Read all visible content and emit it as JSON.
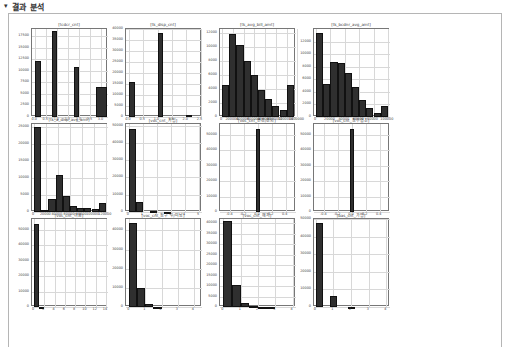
{
  "header": {
    "arrow": "▾",
    "title": "결과 분석"
  },
  "chart_data": [
    {
      "type": "bar",
      "title": "[tcdcr_cnt]",
      "categories": [
        "0.0",
        "0.5",
        "1.0",
        "1.5",
        "2.0",
        "2.5",
        "3.0"
      ],
      "bins": [
        {
          "x0": 0.0,
          "x1": 0.25,
          "value": 12000
        },
        {
          "x0": 0.75,
          "x1": 1.0,
          "value": 18500
        },
        {
          "x0": 1.75,
          "x1": 2.0,
          "value": 10800
        },
        {
          "x0": 2.75,
          "x1": 3.25,
          "value": 6500
        }
      ],
      "xlim": [
        -0.15,
        3.3
      ],
      "ylim": [
        0,
        19000
      ],
      "yticks": [
        0,
        2500,
        5000,
        7500,
        10000,
        12500,
        15000,
        17500
      ],
      "xticks": [
        0.0,
        0.5,
        1.0,
        1.5,
        2.0,
        2.5,
        3.0
      ],
      "xtick_labels": [
        "0.0",
        "0.5",
        "1.0",
        "1.5",
        "2.0",
        "2.5",
        "3.0"
      ]
    },
    {
      "type": "bar",
      "title": "[tk_disp_cnt]",
      "bins": [
        {
          "x0": 0.0,
          "x1": 0.2,
          "value": 16000
        },
        {
          "x0": 1.0,
          "x1": 1.2,
          "value": 38000
        },
        {
          "x0": 2.0,
          "x1": 2.2,
          "value": 800
        }
      ],
      "xlim": [
        -0.1,
        2.55
      ],
      "ylim": [
        0,
        40000
      ],
      "yticks": [
        0,
        5000,
        10000,
        15000,
        20000,
        25000,
        30000,
        35000,
        40000
      ],
      "xticks": [
        0.0,
        0.5,
        1.0,
        1.5,
        2.0,
        2.5
      ],
      "xtick_labels": [
        "0.0",
        "0.5",
        "1.0",
        "1.5",
        "2.0",
        "2.5"
      ]
    },
    {
      "type": "bar",
      "title": "[tk_avg_bill_amt]",
      "bins": [
        {
          "x0": 0,
          "x1": 1,
          "value": 4500
        },
        {
          "x0": 1,
          "x1": 2,
          "value": 11800
        },
        {
          "x0": 2,
          "x1": 3,
          "value": 10200
        },
        {
          "x0": 3,
          "x1": 4,
          "value": 7900
        },
        {
          "x0": 4,
          "x1": 5,
          "value": 6000
        },
        {
          "x0": 5,
          "x1": 6,
          "value": 3800
        },
        {
          "x0": 6,
          "x1": 7,
          "value": 2500
        },
        {
          "x0": 7,
          "x1": 8,
          "value": 1600
        },
        {
          "x0": 8,
          "x1": 9,
          "value": 1000
        },
        {
          "x0": 9,
          "x1": 10,
          "value": 4500
        }
      ],
      "xlim": [
        -0.3,
        10.3
      ],
      "ylim": [
        0,
        12500
      ],
      "yticks": [
        0,
        2000,
        4000,
        6000,
        8000,
        10000,
        12000
      ],
      "xticks": [
        0,
        1.5,
        3,
        4.5,
        6,
        7.5,
        9,
        10.5
      ],
      "xtick_labels": [
        "0",
        "200000",
        "400000",
        "600000",
        "800000",
        "1000000",
        "1200000",
        "1400000"
      ]
    },
    {
      "type": "bar",
      "title": "[tk_bcdnr_avg_amt]",
      "bins": [
        {
          "x0": 0,
          "x1": 1,
          "value": 13300
        },
        {
          "x0": 1,
          "x1": 2,
          "value": 5200
        },
        {
          "x0": 2,
          "x1": 3,
          "value": 8700
        },
        {
          "x0": 3,
          "x1": 4,
          "value": 8600
        },
        {
          "x0": 4,
          "x1": 5,
          "value": 7000
        },
        {
          "x0": 5,
          "x1": 6,
          "value": 4800
        },
        {
          "x0": 6,
          "x1": 7,
          "value": 2700
        },
        {
          "x0": 7,
          "x1": 8,
          "value": 1400
        },
        {
          "x0": 8,
          "x1": 9,
          "value": 700
        },
        {
          "x0": 9,
          "x1": 10,
          "value": 1800
        }
      ],
      "xlim": [
        -0.3,
        10.3
      ],
      "ylim": [
        0,
        14000
      ],
      "yticks": [
        0,
        2000,
        4000,
        6000,
        8000,
        10000,
        12000
      ],
      "xticks": [
        0,
        2,
        4,
        6,
        8,
        10
      ],
      "xtick_labels": [
        "0",
        "20000",
        "40000",
        "60000",
        "80000",
        "100000"
      ]
    },
    {
      "type": "bar",
      "title": "[tk_a_disp_avg_amt]",
      "bins": [
        {
          "x0": 0,
          "x1": 1,
          "value": 25000
        },
        {
          "x0": 1,
          "x1": 2,
          "value": 500
        },
        {
          "x0": 2,
          "x1": 3,
          "value": 3800
        },
        {
          "x0": 3,
          "x1": 4,
          "value": 11000
        },
        {
          "x0": 4,
          "x1": 5,
          "value": 4700
        },
        {
          "x0": 5,
          "x1": 6,
          "value": 1700
        },
        {
          "x0": 6,
          "x1": 7,
          "value": 1300
        },
        {
          "x0": 7,
          "x1": 8,
          "value": 1200
        },
        {
          "x0": 8,
          "x1": 9,
          "value": 800
        },
        {
          "x0": 9,
          "x1": 10,
          "value": 2600
        }
      ],
      "xlim": [
        -0.3,
        10.3
      ],
      "ylim": [
        0,
        26000
      ],
      "yticks": [
        0,
        5000,
        10000,
        15000,
        20000,
        25000
      ],
      "xticks": [
        0,
        1.7,
        3.3,
        5,
        6.7,
        8.3,
        10
      ],
      "xtick_labels": [
        "0",
        "20000",
        "40000",
        "60000",
        "80000",
        "100000",
        "120000"
      ]
    },
    {
      "type": "bar",
      "title": "[voc_cnt_가입]",
      "bins": [
        {
          "x0": 0,
          "x1": 0.5,
          "value": 48000
        },
        {
          "x0": 0.5,
          "x1": 1,
          "value": 6000
        },
        {
          "x0": 1.5,
          "x1": 2,
          "value": 300
        },
        {
          "x0": 2.5,
          "x1": 3,
          "value": 100
        }
      ],
      "xlim": [
        -0.2,
        5.2
      ],
      "ylim": [
        0,
        51000
      ],
      "yticks": [
        0,
        10000,
        20000,
        30000,
        40000,
        50000
      ],
      "xticks": [
        0,
        1,
        2,
        3,
        4,
        5
      ],
      "xtick_labels": [
        "0",
        "1",
        "2",
        "3",
        "4",
        "5"
      ]
    },
    {
      "type": "bar",
      "title": "[voc_cnt_변경/조회]",
      "bins": [
        {
          "x0": -0.025,
          "x1": 0.025,
          "value": 54000
        }
      ],
      "xlim": [
        -0.55,
        0.55
      ],
      "ylim": [
        0,
        57000
      ],
      "yticks": [
        0,
        10000,
        20000,
        30000,
        40000,
        50000
      ],
      "xticks": [
        -0.4,
        -0.2,
        0.0,
        0.2,
        0.4
      ],
      "xtick_labels": [
        "-0.4",
        "-0.2",
        "0.0",
        "0.2",
        "0.4"
      ]
    },
    {
      "type": "bar",
      "title": "[voc_cnt_정우협조]",
      "bins": [
        {
          "x0": -0.025,
          "x1": 0.025,
          "value": 54000
        }
      ],
      "xlim": [
        -0.55,
        0.55
      ],
      "ylim": [
        0,
        57000
      ],
      "yticks": [
        0,
        10000,
        20000,
        30000,
        40000,
        50000
      ],
      "xticks": [
        -0.4,
        -0.2,
        0.0,
        0.2,
        0.4
      ],
      "xtick_labels": [
        "-0.4",
        "-0.2",
        "0.0",
        "0.2",
        "0.4"
      ]
    },
    {
      "type": "bar",
      "title": "[voc_cnt_이용]",
      "bins": [
        {
          "x0": 0,
          "x1": 1,
          "value": 54000
        },
        {
          "x0": 1,
          "x1": 2,
          "value": 200
        }
      ],
      "xlim": [
        -0.4,
        14.4
      ],
      "ylim": [
        0,
        57000
      ],
      "yticks": [
        0,
        10000,
        20000,
        30000,
        40000,
        50000
      ],
      "xticks": [
        0,
        2,
        4,
        6,
        8,
        10,
        12,
        14
      ],
      "xtick_labels": [
        "0",
        "2",
        "4",
        "6",
        "8",
        "10",
        "12",
        "14"
      ]
    },
    {
      "type": "bar",
      "title": "[voc_cnt_청구 수/미납]",
      "bins": [
        {
          "x0": 0,
          "x1": 0.5,
          "value": 44000
        },
        {
          "x0": 0.5,
          "x1": 1,
          "value": 10000
        },
        {
          "x0": 1,
          "x1": 1.5,
          "value": 1500
        },
        {
          "x0": 1.5,
          "x1": 2,
          "value": 200
        }
      ],
      "xlim": [
        -0.2,
        4.5
      ],
      "ylim": [
        0,
        46000
      ],
      "yticks": [
        0,
        10000,
        20000,
        30000,
        40000
      ],
      "xticks": [
        0,
        1,
        2,
        3,
        4
      ],
      "xtick_labels": [
        "0",
        "1",
        "2",
        "3",
        "4"
      ]
    },
    {
      "type": "bar",
      "title": "[voc_cnt_해지]",
      "bins": [
        {
          "x0": 0,
          "x1": 0.5,
          "value": 41000
        },
        {
          "x0": 0.5,
          "x1": 1,
          "value": 10500
        },
        {
          "x0": 1,
          "x1": 1.5,
          "value": 2000
        },
        {
          "x0": 1.5,
          "x1": 2,
          "value": 400
        },
        {
          "x0": 2,
          "x1": 2.5,
          "value": 100
        },
        {
          "x0": 2.5,
          "x1": 3,
          "value": 100
        }
      ],
      "xlim": [
        -0.2,
        4.2
      ],
      "ylim": [
        0,
        42000
      ],
      "yticks": [
        0,
        5000,
        10000,
        15000,
        20000,
        25000,
        30000,
        35000,
        40000
      ],
      "xticks": [
        0,
        1,
        2,
        3,
        4
      ],
      "xtick_labels": [
        "0",
        "1",
        "2",
        "3",
        "4"
      ]
    },
    {
      "type": "bar",
      "title": "[bas_cnt_가입]",
      "bins": [
        {
          "x0": 0,
          "x1": 0.4,
          "value": 48000
        },
        {
          "x0": 0.8,
          "x1": 1.2,
          "value": 6000
        },
        {
          "x0": 1.8,
          "x1": 2.2,
          "value": 200
        }
      ],
      "xlim": [
        -0.1,
        4.2
      ],
      "ylim": [
        0,
        50000
      ],
      "yticks": [
        0,
        10000,
        20000,
        30000,
        40000,
        50000
      ],
      "xticks": [
        0,
        1,
        2,
        3,
        4
      ],
      "xtick_labels": [
        "0",
        "1",
        "2",
        "3",
        "4"
      ]
    }
  ]
}
